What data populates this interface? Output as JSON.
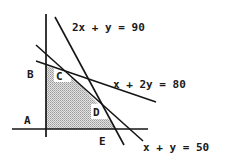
{
  "diagram": {
    "type": "linear-programming-feasible-region",
    "constraints": [
      {
        "id": "c1",
        "label": "2x + y = 90"
      },
      {
        "id": "c2",
        "label": "x + 2y = 80"
      },
      {
        "id": "c3",
        "label": "x + y = 50"
      }
    ],
    "points": [
      {
        "id": "A",
        "label": "A"
      },
      {
        "id": "B",
        "label": "B"
      },
      {
        "id": "C",
        "label": "C"
      },
      {
        "id": "D",
        "label": "D"
      },
      {
        "id": "E",
        "label": "E"
      }
    ],
    "colors": {
      "line": "#151515",
      "shade": "#c8c8c8",
      "background": "#ffffff"
    }
  }
}
